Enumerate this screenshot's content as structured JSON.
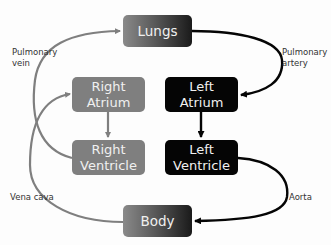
{
  "diagram": {
    "nodes": {
      "lungs": {
        "line1": "Lungs"
      },
      "right_atrium": {
        "line1": "Right",
        "line2": "Atrium"
      },
      "left_atrium": {
        "line1": "Left",
        "line2": "Atrium"
      },
      "right_ventricle": {
        "line1": "Right",
        "line2": "Ventricle"
      },
      "left_ventricle": {
        "line1": "Left",
        "line2": "Ventricle"
      },
      "body": {
        "line1": "Body"
      }
    },
    "edge_labels": {
      "pulmonary_vein": {
        "line1": "Pulmonary",
        "line2": "vein"
      },
      "pulmonary_artery": {
        "line1": "Pulmonary",
        "line2": "artery"
      },
      "vena_cava": {
        "line1": "Vena cava"
      },
      "aorta": {
        "line1": "Aorta"
      }
    },
    "colors": {
      "deoxygenated": "#7f7f7f",
      "oxygenated": "#050505",
      "text_on_box": "#f0f0f0",
      "label_text": "#333333"
    }
  }
}
